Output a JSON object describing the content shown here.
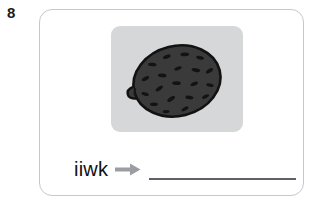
{
  "item": {
    "number": "8",
    "type": "word-unscramble-exercise"
  },
  "picture": {
    "alt_name": "kiwi-fruit-illustration",
    "background_color": "#d6d7d8",
    "fruit_fill_color": "#3a3a3a",
    "fruit_outline_color": "#111111",
    "seed_color": "#141414"
  },
  "answer_row": {
    "scrambled_word": "iiwk",
    "arrow_icon": "arrow-right-icon",
    "arrow_color": "#9a9da1",
    "blank_line_color": "#5d6066",
    "answer_value": ""
  },
  "card": {
    "border_color": "#c6c8cb",
    "background_color": "#ffffff"
  }
}
